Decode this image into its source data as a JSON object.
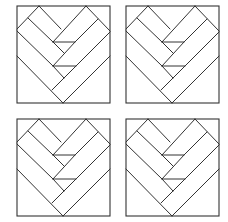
{
  "figure": {
    "line_color": "#333333",
    "background_color": "#ffffff",
    "tiles": [
      {
        "id": "top-left",
        "x": 17,
        "y": 6
      },
      {
        "id": "top-right",
        "x": 126,
        "y": 6
      },
      {
        "id": "bottom-left",
        "x": 17,
        "y": 119
      },
      {
        "id": "bottom-right",
        "x": 126,
        "y": 119
      }
    ],
    "tile_size": {
      "width": 93,
      "height": 97
    },
    "pattern": "chevron-heart"
  }
}
